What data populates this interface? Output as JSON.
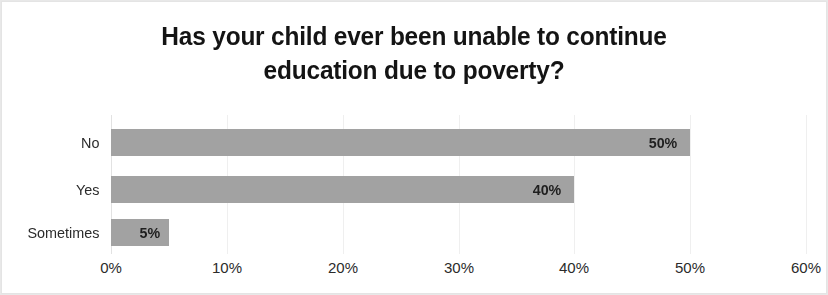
{
  "chart_data": {
    "type": "bar",
    "orientation": "horizontal",
    "title": "Has your child ever been unable to continue education due to poverty?",
    "title_lines": [
      "Has your child ever been unable to continue",
      "education due to poverty?"
    ],
    "categories": [
      "No",
      "Yes",
      "Sometimes"
    ],
    "values": [
      50,
      40,
      5
    ],
    "data_labels": [
      "50%",
      "40%",
      "5%"
    ],
    "xlabel": "",
    "ylabel": "",
    "xlim": [
      0,
      60
    ],
    "xticks": [
      0,
      10,
      20,
      30,
      40,
      50,
      60
    ],
    "xtick_labels": [
      "0%",
      "10%",
      "20%",
      "30%",
      "40%",
      "50%",
      "60%"
    ],
    "grid": true,
    "grid_axis": "x",
    "legend": false,
    "bar_color": "#a2a2a2",
    "label_color": "#1f1f1f",
    "gridline_color": "#efefef",
    "background": "#ffffff"
  }
}
